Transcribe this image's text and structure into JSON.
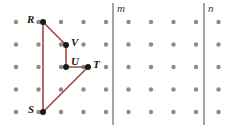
{
  "figure": {
    "canvas": {
      "width": 250,
      "height": 133,
      "background": "#ffffff"
    },
    "grid": {
      "origin_x": 16,
      "origin_y": 22,
      "spacing_x": 22.5,
      "spacing_y": 22.5,
      "columns": 10,
      "rows": 5,
      "dot_radius": 2.2,
      "dot_color": "#8c8c8c"
    },
    "shape": {
      "name": "RVUTS",
      "stroke_color": "#9e4848",
      "stroke_width": 1.6,
      "closed": true,
      "path_order": [
        "R",
        "V",
        "U",
        "T",
        "S"
      ]
    },
    "vertices": [
      {
        "id": "R",
        "label": "R",
        "x": 43,
        "y": 22,
        "label_x": 27,
        "label_y": 14,
        "dot_color": "#1a1a1a",
        "dot_radius": 3.0
      },
      {
        "id": "V",
        "label": "V",
        "x": 66,
        "y": 45,
        "label_x": 71,
        "label_y": 37,
        "dot_color": "#1a1a1a",
        "dot_radius": 3.0
      },
      {
        "id": "U",
        "label": "U",
        "x": 66,
        "y": 67,
        "label_x": 71,
        "label_y": 56,
        "dot_color": "#1a1a1a",
        "dot_radius": 3.0
      },
      {
        "id": "T",
        "label": "T",
        "x": 88,
        "y": 67,
        "label_x": 93,
        "label_y": 59,
        "dot_color": "#1a1a1a",
        "dot_radius": 3.0
      },
      {
        "id": "S",
        "label": "S",
        "x": 43,
        "y": 112,
        "label_x": 28,
        "label_y": 104,
        "dot_color": "#1a1a1a",
        "dot_radius": 3.0
      }
    ],
    "segments": [
      {
        "id": "RV",
        "from": "R",
        "to": "V",
        "x1": 43,
        "y1": 22,
        "x2": 66,
        "y2": 45
      },
      {
        "id": "VU",
        "from": "V",
        "to": "U",
        "x1": 66,
        "y1": 45,
        "x2": 66,
        "y2": 67
      },
      {
        "id": "UT",
        "from": "U",
        "to": "T",
        "x1": 66,
        "y1": 67,
        "x2": 88,
        "y2": 67
      },
      {
        "id": "TS",
        "from": "T",
        "to": "S",
        "x1": 88,
        "y1": 67,
        "x2": 43,
        "y2": 112
      },
      {
        "id": "SR",
        "from": "S",
        "to": "R",
        "x1": 43,
        "y1": 112,
        "x2": 43,
        "y2": 22
      }
    ],
    "lines": [
      {
        "id": "m",
        "label": "m",
        "x": 113,
        "y_top": 3,
        "y_bottom": 125,
        "label_x": 117,
        "label_y": 3,
        "stroke_color": "#5a5a5a",
        "stroke_width": 1.1
      },
      {
        "id": "n",
        "label": "n",
        "x": 204,
        "y_top": 3,
        "y_bottom": 125,
        "label_x": 208,
        "label_y": 3,
        "stroke_color": "#5a5a5a",
        "stroke_width": 1.1
      }
    ]
  }
}
